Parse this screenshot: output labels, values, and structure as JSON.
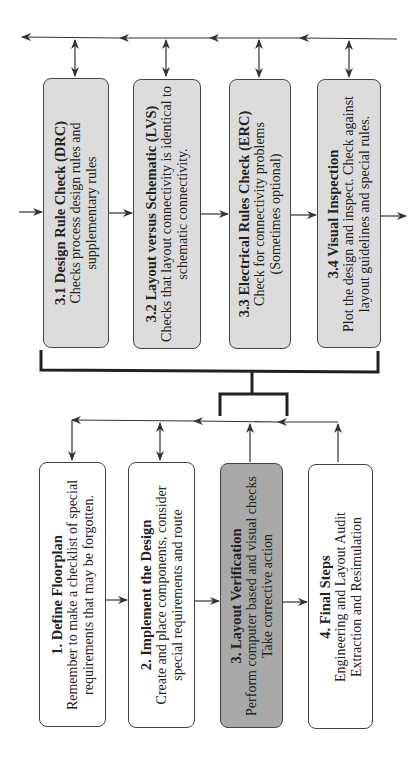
{
  "diagram": {
    "orientation": "rotated-90-ccw",
    "verification_steps": [
      {
        "id": "3.1",
        "title": "3.1 Design Rule Check (DRC)",
        "lines": [
          "Checks process design rules and",
          "supplementary rules"
        ]
      },
      {
        "id": "3.2",
        "title": "3.2 Layout  versus Schematic (LVS)",
        "lines": [
          "Checks that layout connectivity is identical to",
          "schematic connectivity."
        ]
      },
      {
        "id": "3.3",
        "title": "3.3 Electrical Rules Check (ERC)",
        "lines": [
          "Check for connectivity problems",
          "(Sometimes optional)"
        ]
      },
      {
        "id": "3.4",
        "title": "3.4 Visual Inspection",
        "lines": [
          "Plot the design and inspect. Check against",
          "layout guidelines and special rules."
        ]
      }
    ],
    "main_steps": [
      {
        "id": "1",
        "title": "1. Define Floorplan",
        "lines": [
          "Remember to make a checklist of special",
          "requirements that may be forgotten."
        ],
        "highlighted": false
      },
      {
        "id": "2",
        "title": "2. Implement the Design",
        "lines": [
          "Create and place components, consider",
          "special requirements and route"
        ],
        "highlighted": false
      },
      {
        "id": "3",
        "title": "3. Layout Verification",
        "lines": [
          "Perform computer based and visual checks",
          "Take corrective action"
        ],
        "highlighted": true
      },
      {
        "id": "4",
        "title": "4. Final Steps",
        "lines": [
          "Engineering and Layout Audit",
          "Extraction and Resimulation"
        ],
        "highlighted": false
      }
    ],
    "colors": {
      "sub_box_fill": "#dcdcdc",
      "highlight_fill": "#a9a9a9",
      "box_border": "#444444",
      "line": "#333333"
    }
  }
}
